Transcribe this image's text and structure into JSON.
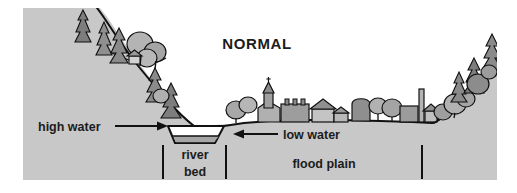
{
  "figure": {
    "title": "NORMAL",
    "labels": {
      "high_water": "high water",
      "low_water": "low water",
      "river_bed_line1": "river",
      "river_bed_line2": "bed",
      "flood_plain": "flood plain"
    },
    "colors": {
      "ground": "#c8c8c8",
      "sky": "#ffffff",
      "water": "#a6a6a6",
      "vegetation_dark": "#7d7d7d",
      "vegetation_mid": "#9a9a9a",
      "vegetation_light": "#b4b4b4",
      "outline": "#111111",
      "text": "#1c1c1c"
    },
    "scene": {
      "description_elements": [
        "left-hillside",
        "right-hillside",
        "river-bed",
        "flood-plain",
        "village",
        "trees",
        "high-water-arrow",
        "low-water-arrow",
        "river-bed-ticks",
        "flood-plain-ticks"
      ]
    }
  }
}
